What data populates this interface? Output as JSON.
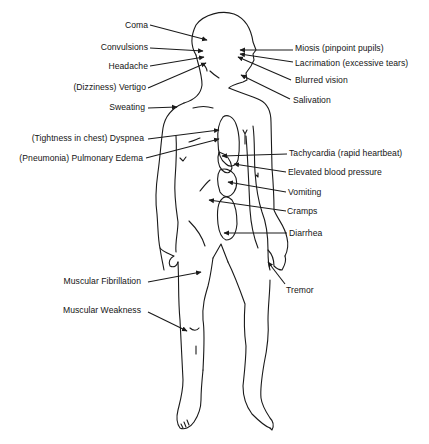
{
  "diagram": {
    "type": "anatomical-symptom-diagram",
    "colors": {
      "line": "#1a1a1a",
      "text": "#141414",
      "background": "#ffffff"
    },
    "labels_left": [
      {
        "id": "coma",
        "text": "Coma"
      },
      {
        "id": "convulsions",
        "text": "Convulsions"
      },
      {
        "id": "headache",
        "text": "Headache"
      },
      {
        "id": "vertigo",
        "text": "(Dizziness) Vertigo"
      },
      {
        "id": "sweating",
        "text": "Sweating"
      },
      {
        "id": "dyspnea",
        "text": "(Tightness in chest) Dyspnea"
      },
      {
        "id": "pulmonary-edema",
        "text": "(Pneumonia) Pulmonary Edema"
      },
      {
        "id": "muscular-fibrillation",
        "text": "Muscular Fibrillation"
      },
      {
        "id": "muscular-weakness",
        "text": "Muscular Weakness"
      }
    ],
    "labels_right": [
      {
        "id": "miosis",
        "text": "Miosis (pinpoint pupils)"
      },
      {
        "id": "lacrimation",
        "text": "Lacrimation (excessive tears)"
      },
      {
        "id": "blurred-vision",
        "text": "Blurred vision"
      },
      {
        "id": "salivation",
        "text": "Salivation"
      },
      {
        "id": "tachycardia",
        "text": "Tachycardia (rapid heartbeat)"
      },
      {
        "id": "elevated-bp",
        "text": "Elevated blood pressure"
      },
      {
        "id": "vomiting",
        "text": "Vomiting"
      },
      {
        "id": "cramps",
        "text": "Cramps"
      },
      {
        "id": "diarrhea",
        "text": "Diarrhea"
      },
      {
        "id": "tremor",
        "text": "Tremor"
      }
    ]
  }
}
